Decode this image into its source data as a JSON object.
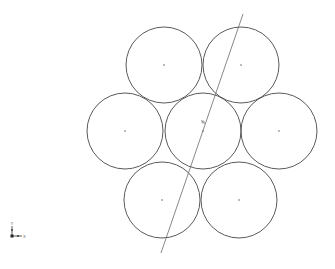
{
  "viewport": {
    "background": "#ffffff",
    "stroke_color": "#5a5a5a",
    "line_color": "#6a6a6a"
  },
  "drawing": {
    "circle_radius": 38,
    "circles": [
      {
        "id": "top-left",
        "cx": 164,
        "cy": 65
      },
      {
        "id": "top-right",
        "cx": 241,
        "cy": 65
      },
      {
        "id": "middle-left",
        "cx": 125,
        "cy": 131
      },
      {
        "id": "center",
        "cx": 203,
        "cy": 131
      },
      {
        "id": "middle-right",
        "cx": 279,
        "cy": 131
      },
      {
        "id": "bottom-left",
        "cx": 162,
        "cy": 200
      },
      {
        "id": "bottom-right",
        "cx": 239,
        "cy": 200
      }
    ],
    "section_line": {
      "x1": 243,
      "y1": 14,
      "x2": 161,
      "y2": 253
    },
    "origin_marker": {
      "x": 203,
      "y": 122
    }
  },
  "triad": {
    "x_label": "X",
    "y_label": "Y",
    "origin": {
      "x": 12,
      "y": 236
    }
  }
}
